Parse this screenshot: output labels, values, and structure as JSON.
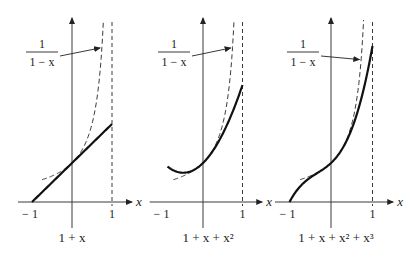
{
  "figure": {
    "panels": [
      {
        "id": "linear",
        "caption": "1 + x",
        "caption_parts": [
          "1 + ",
          "x"
        ],
        "approximation_terms": 2,
        "x_tick_labels": [
          "− 1",
          "1"
        ],
        "axis_label": "x",
        "reference_curve_label": {
          "numerator": "1",
          "denominator": "1 − x"
        }
      },
      {
        "id": "quadratic",
        "caption": "1 + x + x²",
        "approximation_terms": 3,
        "x_tick_labels": [
          "− 1",
          "1"
        ],
        "axis_label": "x",
        "reference_curve_label": {
          "numerator": "1",
          "denominator": "1 − x"
        }
      },
      {
        "id": "cubic",
        "caption": "1 + x + x² + x³",
        "approximation_terms": 4,
        "x_tick_labels": [
          "− 1",
          "1"
        ],
        "axis_label": "x",
        "reference_curve_label": {
          "numerator": "1",
          "denominator": "1 − x"
        }
      }
    ],
    "reference_function": "1/(1-x)",
    "x_domain": [
      -1,
      1
    ],
    "asymptote_x": 1
  }
}
